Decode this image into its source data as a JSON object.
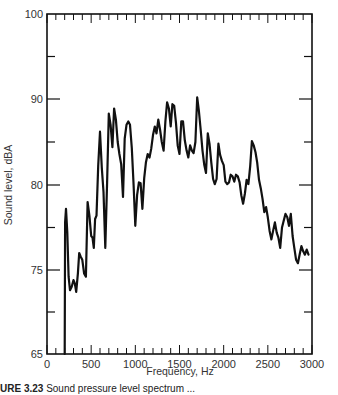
{
  "chart_data": {
    "type": "line",
    "title": "",
    "xlabel": "Frequency, Hz",
    "ylabel": "Sound level, dBA",
    "xlim": [
      0,
      3000
    ],
    "ylim": [
      65,
      100
    ],
    "x_ticks": [
      0,
      500,
      1000,
      1500,
      2000,
      2500,
      3000
    ],
    "x_tick_labels": [
      "0",
      "500",
      "1000",
      "1500",
      "2000",
      "2500",
      "3000"
    ],
    "x_minor_step": 100,
    "y_ticks": [
      65,
      75,
      80,
      90,
      100
    ],
    "y_tick_labels": [
      "65",
      "75",
      "80",
      "90",
      "100"
    ],
    "y_axis_note": "Non-uniform labeled scale: equal spacing between 100, 90, 80, 75, 65 label positions with minor ticks midway",
    "grid": false,
    "legend": null,
    "series": [
      {
        "name": "Sound level",
        "x": [
          200,
          205,
          215,
          230,
          245,
          260,
          280,
          300,
          315,
          330,
          350,
          365,
          380,
          400,
          420,
          440,
          460,
          480,
          500,
          515,
          530,
          545,
          560,
          580,
          600,
          620,
          640,
          660,
          680,
          700,
          720,
          740,
          760,
          780,
          800,
          820,
          840,
          860,
          880,
          900,
          920,
          940,
          960,
          980,
          1000,
          1020,
          1040,
          1060,
          1080,
          1100,
          1120,
          1140,
          1160,
          1180,
          1200,
          1220,
          1240,
          1260,
          1280,
          1300,
          1320,
          1340,
          1360,
          1380,
          1400,
          1420,
          1440,
          1460,
          1480,
          1500,
          1520,
          1540,
          1560,
          1580,
          1600,
          1620,
          1640,
          1660,
          1680,
          1700,
          1720,
          1740,
          1760,
          1780,
          1800,
          1820,
          1840,
          1860,
          1880,
          1900,
          1920,
          1940,
          1960,
          1980,
          2000,
          2020,
          2040,
          2060,
          2080,
          2100,
          2120,
          2140,
          2160,
          2180,
          2200,
          2220,
          2240,
          2260,
          2280,
          2300,
          2320,
          2340,
          2360,
          2380,
          2400,
          2420,
          2440,
          2460,
          2480,
          2500,
          2520,
          2540,
          2560,
          2580,
          2600,
          2620,
          2640,
          2660,
          2680,
          2700,
          2720,
          2740,
          2760,
          2780,
          2800,
          2820,
          2840,
          2860,
          2880,
          2900,
          2920,
          2940,
          2960
        ],
        "y": [
          65,
          77.8,
          78.6,
          77.2,
          74.2,
          72.6,
          73.0,
          73.8,
          73.4,
          72.4,
          74.6,
          76.0,
          75.8,
          75.6,
          74.6,
          74.2,
          79.0,
          78.2,
          77.0,
          76.9,
          76.3,
          78.0,
          78.2,
          82.2,
          86.2,
          82.0,
          79.6,
          76.3,
          80.3,
          88.3,
          87.0,
          84.4,
          88.9,
          87.6,
          85.0,
          83.6,
          82.4,
          79.3,
          85.4,
          87.0,
          87.4,
          87.0,
          84.3,
          80.0,
          77.6,
          79.4,
          80.3,
          80.2,
          78.6,
          80.8,
          82.6,
          83.6,
          83.2,
          84.2,
          85.8,
          86.8,
          86.0,
          87.6,
          86.4,
          85.0,
          84.0,
          87.4,
          89.6,
          88.9,
          86.8,
          89.4,
          89.2,
          87.2,
          84.6,
          83.6,
          87.4,
          87.4,
          85.2,
          84.0,
          83.2,
          84.6,
          84.0,
          83.7,
          85.0,
          90.2,
          88.6,
          86.4,
          84.0,
          82.4,
          81.4,
          86.0,
          84.8,
          82.6,
          80.7,
          80.1,
          80.7,
          84.8,
          83.5,
          82.8,
          82.3,
          80.4,
          80.1,
          80.3,
          81.2,
          81.0,
          80.4,
          81.2,
          81.0,
          80.3,
          79.4,
          78.9,
          79.5,
          80.6,
          80.1,
          82.2,
          85.1,
          84.6,
          83.8,
          82.6,
          80.6,
          79.8,
          79.2,
          78.4,
          78.7,
          78.1,
          77.3,
          76.8,
          77.3,
          77.8,
          77.2,
          76.9,
          76.3,
          77.5,
          77.9,
          78.3,
          78.1,
          77.6,
          78.3,
          77.0,
          76.3,
          75.6,
          75.4,
          75.9,
          76.4,
          76.1,
          75.9,
          76.2,
          75.9
        ]
      }
    ]
  },
  "caption": {
    "label": "URE 3.23",
    "text": "Sound pressure level spectrum ..."
  }
}
